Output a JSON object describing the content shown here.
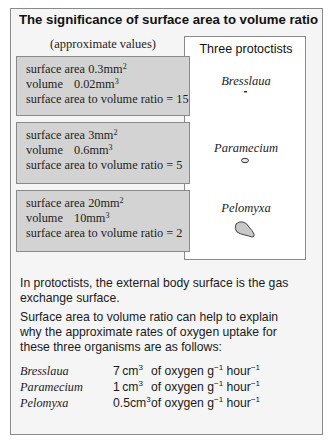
{
  "title": "The significance of surface area to volume ratio",
  "left_caption": "(approximate values)",
  "protists_panel": {
    "title": "Three protoctists",
    "organisms": [
      {
        "name": "Bresslaua",
        "shape": "tiny-dash"
      },
      {
        "name": "Paramecium",
        "shape": "small-oval"
      },
      {
        "name": "Pelomyxa",
        "shape": "irregular-blob"
      }
    ]
  },
  "boxes": [
    {
      "sa_label": "surface area",
      "sa_value": "0.3",
      "sa_unit": "mm",
      "sa_exp": "2",
      "vol_label": "volume",
      "vol_value": "0.02",
      "vol_unit": "mm",
      "vol_exp": "3",
      "ratio_label": "surface area to volume ratio =",
      "ratio_value": "15"
    },
    {
      "sa_label": "surface area",
      "sa_value": "3",
      "sa_unit": "mm",
      "sa_exp": "2",
      "vol_label": "volume",
      "vol_value": "0.6",
      "vol_unit": "mm",
      "vol_exp": "3",
      "ratio_label": "surface area to volume ratio =",
      "ratio_value": "5"
    },
    {
      "sa_label": "surface area",
      "sa_value": "20",
      "sa_unit": "mm",
      "sa_exp": "2",
      "vol_label": "volume",
      "vol_value": "10",
      "vol_unit": "mm",
      "vol_exp": "3",
      "ratio_label": "surface area to volume ratio =",
      "ratio_value": "2"
    }
  ],
  "paragraphs": [
    "In protoctists, the external body surface is the gas exchange surface.",
    "Surface area to volume ratio can help to explain why the approximate rates of oxygen uptake for these three organisms are as follows:"
  ],
  "rates": [
    {
      "organism": "Bresslaua",
      "value": "7",
      "unit": "cm",
      "unit_exp": "3",
      "text": "of oxygen g",
      "g_exp": "−1",
      "hour": " hour",
      "hour_exp": "−1"
    },
    {
      "organism": "Paramecium",
      "value": "1",
      "unit": "cm",
      "unit_exp": "3",
      "text": "of oxygen g",
      "g_exp": "−1",
      "hour": " hour",
      "hour_exp": "−1"
    },
    {
      "organism": "Pelomyxa",
      "value": "0.5",
      "unit": "cm",
      "unit_exp": "3",
      "text": "of oxygen g",
      "g_exp": "−1",
      "hour": " hour",
      "hour_exp": "−1"
    }
  ],
  "colors": {
    "frame_border": "#8a8a8a",
    "frame_bg": "#f5f5f5",
    "box_fill": "#d3d3d3",
    "panel_bg": "#ffffff",
    "organism_fill": "#c8c8c8"
  }
}
